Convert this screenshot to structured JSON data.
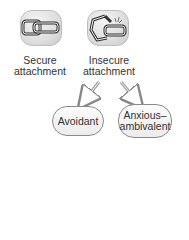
{
  "diagram": {
    "nodes": [
      {
        "id": "secure",
        "icon": "intact-chain-link-icon",
        "label_line1": "Secure",
        "label_line2": "attachment"
      },
      {
        "id": "insecure",
        "icon": "broken-chain-link-icon",
        "label_line1": "Insecure",
        "label_line2": "attachment"
      },
      {
        "id": "avoidant",
        "label": "Avoidant"
      },
      {
        "id": "anxious",
        "label_line1": "Anxious–",
        "label_line2": "ambivalent"
      }
    ],
    "edges": [
      {
        "from": "insecure",
        "to": "avoidant"
      },
      {
        "from": "insecure",
        "to": "anxious"
      }
    ]
  }
}
